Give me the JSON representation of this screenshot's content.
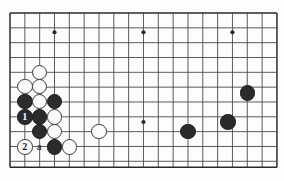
{
  "diagram": {
    "kind": "go-board-diagram",
    "title": "",
    "board": {
      "line_color": "#4a4a4a",
      "edge_color": "#2a2a2a",
      "background": "#fdfdfb",
      "origin_x": 10,
      "origin_y": 13,
      "spacing": 14.83,
      "cols": 19,
      "rows": 11,
      "star_points": [
        {
          "col": 3,
          "row": 1.3
        },
        {
          "col": 9,
          "row": 1.3
        },
        {
          "col": 15,
          "row": 1.3
        },
        {
          "col": 9,
          "row": 7.35
        }
      ]
    },
    "stones": [
      {
        "name": "white-stone-corner-top",
        "color": "white",
        "col": 2,
        "row": 4.0
      },
      {
        "name": "white-stone-left-upper",
        "color": "white",
        "col": 1,
        "row": 4.95
      },
      {
        "name": "white-stone-mid-upper",
        "color": "white",
        "col": 2,
        "row": 4.95
      },
      {
        "name": "black-stone-left-a",
        "color": "black",
        "col": 1,
        "row": 5.95
      },
      {
        "name": "white-stone-center",
        "color": "white",
        "col": 2,
        "row": 5.95
      },
      {
        "name": "black-stone-right-wall",
        "color": "black",
        "col": 3,
        "row": 5.95
      },
      {
        "name": "black-stone-move-1",
        "color": "black",
        "col": 1,
        "row": 7.0,
        "label": "1"
      },
      {
        "name": "black-stone-center-low",
        "color": "black",
        "col": 2,
        "row": 7.0
      },
      {
        "name": "white-stone-right-mid",
        "color": "white",
        "col": 3,
        "row": 7.0
      },
      {
        "name": "black-stone-lower",
        "color": "black",
        "col": 2,
        "row": 8.0
      },
      {
        "name": "white-stone-right-lower",
        "color": "white",
        "col": 3,
        "row": 8.0
      },
      {
        "name": "white-stone-move-2",
        "color": "white",
        "col": 1,
        "row": 9.05,
        "label": "2"
      },
      {
        "name": "black-stone-bottom",
        "color": "black",
        "col": 3,
        "row": 9.05
      },
      {
        "name": "white-stone-bottom-right",
        "color": "white",
        "col": 4,
        "row": 9.05
      },
      {
        "name": "white-stone-isolated",
        "color": "white",
        "col": 6,
        "row": 8.0
      },
      {
        "name": "black-stone-right-low",
        "color": "black",
        "col": 12,
        "row": 8.0
      },
      {
        "name": "black-stone-right-mid",
        "color": "black",
        "col": 14.7,
        "row": 7.35
      },
      {
        "name": "black-stone-right-high",
        "color": "black",
        "col": 16,
        "row": 5.4
      }
    ],
    "markers": [
      {
        "name": "point-label-a",
        "text": "a",
        "col": 2,
        "row": 9.05
      }
    ],
    "move_numbers": [
      "1",
      "2"
    ]
  }
}
